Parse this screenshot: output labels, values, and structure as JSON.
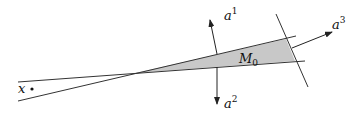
{
  "diagram": {
    "type": "geometric-cone-construction",
    "colors": {
      "line": "#333333",
      "fill": "#c8c8c8",
      "text": "#111111",
      "background": "#ffffff"
    },
    "labels": {
      "point_x": "x",
      "region": "M",
      "region_subscript": "0",
      "vector_1": "a",
      "vector_1_sup": "1",
      "vector_2": "a",
      "vector_2_sup": "2",
      "vector_3": "a",
      "vector_3_sup": "3"
    },
    "elements": [
      {
        "id": "line-upper",
        "kind": "line"
      },
      {
        "id": "line-lower",
        "kind": "line"
      },
      {
        "id": "transversal-line",
        "kind": "line"
      },
      {
        "id": "region-M0",
        "kind": "shaded-triangle"
      },
      {
        "id": "vector-a1",
        "kind": "arrow"
      },
      {
        "id": "vector-a2",
        "kind": "arrow"
      },
      {
        "id": "vector-a3",
        "kind": "arrow"
      },
      {
        "id": "point-x",
        "kind": "dot"
      }
    ]
  }
}
